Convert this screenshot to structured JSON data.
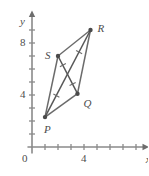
{
  "figure": {
    "background_color": "#ffffff",
    "line_color": "#6b6b6b",
    "axis_color": "#8a8a8a",
    "label_color": "#4d4d4d"
  },
  "axes": {
    "x_axis_label": "x",
    "y_axis_label": "y",
    "origin_label": "0",
    "x_tick_labels": [
      "4"
    ],
    "y_tick_labels": [
      "4",
      "8"
    ],
    "x_ticks": [
      1,
      2,
      3,
      4,
      5,
      6,
      7,
      8
    ],
    "y_ticks": [
      1,
      2,
      3,
      4,
      5,
      6,
      7,
      8,
      9
    ],
    "x_range": [
      -0.4,
      8.9
    ],
    "y_range": [
      -0.6,
      10.3
    ],
    "grid": false
  },
  "chart_data": {
    "type": "scatter",
    "title": "",
    "xlabel": "x",
    "ylabel": "y",
    "xlim": [
      -0.4,
      8.9
    ],
    "ylim": [
      -0.6,
      10.3
    ],
    "grid": false,
    "legend": "none",
    "points": [
      {
        "name": "P",
        "x": 1,
        "y": 2.3,
        "label_dx": -1,
        "label_dy": 13
      },
      {
        "name": "Q",
        "x": 3.5,
        "y": 4.1,
        "label_dx": 6,
        "label_dy": 10
      },
      {
        "name": "R",
        "x": 4.5,
        "y": 9.0,
        "label_dx": 7,
        "label_dy": -1
      },
      {
        "name": "S",
        "x": 2.0,
        "y": 7.0,
        "label_dx": -13,
        "label_dy": 0
      }
    ],
    "sides": [
      [
        "P",
        "Q"
      ],
      [
        "Q",
        "R"
      ],
      [
        "R",
        "S"
      ],
      [
        "S",
        "P"
      ]
    ],
    "diagonals": [
      [
        "P",
        "R"
      ],
      [
        "S",
        "Q"
      ]
    ],
    "congruence_marks": {
      "count": 4,
      "description": "single tick on each half-diagonal indicating the diagonals bisect each other",
      "segments": [
        [
          "P",
          "R"
        ],
        [
          "R",
          "P"
        ],
        [
          "S",
          "Q"
        ],
        [
          "Q",
          "S"
        ]
      ]
    }
  }
}
